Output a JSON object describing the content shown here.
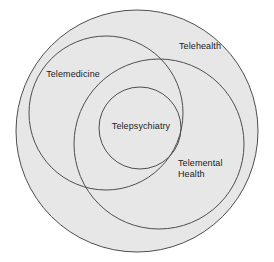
{
  "diagram": {
    "type": "nested-venn",
    "title": "",
    "background_color": "#ffffff",
    "fill_color": "#e7e7e7",
    "stroke_color": "#4e4e4e",
    "text_color": "#1a1a1a",
    "labels": {
      "telehealth": "Telehealth",
      "telemedicine": "Telemedicine",
      "telepsychiatry": "Telepsychiatry",
      "telemental_health": "Telemental\nHealth"
    }
  },
  "chart_data": {
    "type": "diagram",
    "title": "",
    "sets": [
      {
        "name": "Telehealth",
        "label": "Telehealth",
        "cx": 137,
        "cy": 131,
        "r": 121,
        "filled": true,
        "label_x": 200,
        "label_y": 46
      },
      {
        "name": "Telemedicine",
        "label": "Telemedicine",
        "cx": 106,
        "cy": 113,
        "r": 77,
        "filled": false,
        "label_x": 73,
        "label_y": 74
      },
      {
        "name": "Telemental Health",
        "label": "Telemental Health",
        "cx": 159,
        "cy": 144,
        "r": 85,
        "filled": false,
        "label_x": 207,
        "label_y": 169
      },
      {
        "name": "Telepsychiatry",
        "label": "Telepsychiatry",
        "cx": 140,
        "cy": 128,
        "r": 41,
        "filled": false,
        "label_x": 141,
        "label_y": 126
      }
    ],
    "relationships": [
      "Telemedicine is contained within Telehealth",
      "Telemental Health is contained within Telehealth",
      "Telepsychiatry is the intersection of Telemedicine and Telemental Health"
    ]
  }
}
